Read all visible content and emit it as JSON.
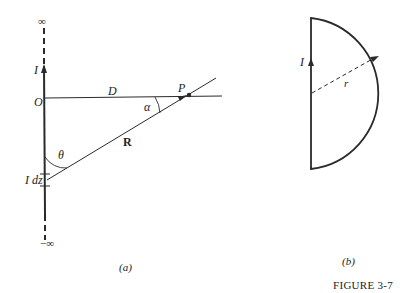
{
  "figure": {
    "caption": "FIGURE 3-7",
    "panel_a": {
      "sublabel": "(a)",
      "labels": {
        "infinity_top": "∞",
        "infinity_bottom": "−∞",
        "current": "I",
        "origin": "O",
        "distance": "D",
        "point": "P",
        "alpha": "α",
        "theta": "θ",
        "vector_r": "R",
        "current_element": "I dz"
      }
    },
    "panel_b": {
      "sublabel": "(b)",
      "labels": {
        "current": "I",
        "radius": "r"
      }
    }
  },
  "colors": {
    "line": "#2a2a2a",
    "background": "#ffffff"
  }
}
